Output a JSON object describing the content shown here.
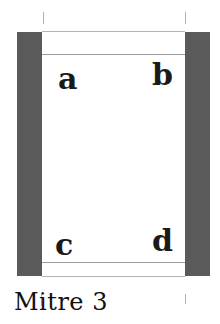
{
  "diagram": {
    "caption": "Mitre 3",
    "corners": {
      "top_left": "a",
      "top_right": "b",
      "bottom_left": "c",
      "bottom_right": "d"
    },
    "colors": {
      "bar": "#5a5a5a",
      "line": "#9a9a9a",
      "text": "#1a1a1a"
    }
  }
}
